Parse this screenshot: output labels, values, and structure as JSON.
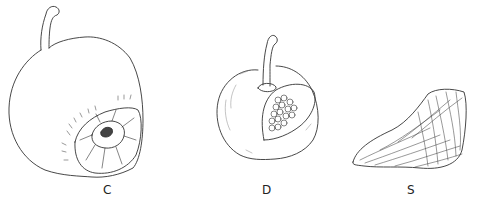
{
  "figures": [
    {
      "id": "C",
      "label": "C",
      "subject": "fruit with basal scar, whole"
    },
    {
      "id": "D",
      "label": "D",
      "subject": "fruit with section cut away showing seeds"
    },
    {
      "id": "S",
      "label": "S",
      "subject": "seed"
    }
  ],
  "colors": {
    "ink": "#333333",
    "background": "#ffffff"
  }
}
